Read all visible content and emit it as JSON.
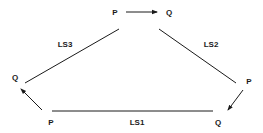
{
  "diagram": {
    "nodes": {
      "top_p": "P",
      "top_q": "Q",
      "left_q": "Q",
      "right_p": "P",
      "bottom_left_p": "P",
      "bottom_right_q": "Q"
    },
    "edges": {
      "ls1": "LS1",
      "ls2": "LS2",
      "ls3": "LS3"
    },
    "colors": {
      "stroke": "#1a1a1a",
      "background": "#ffffff"
    }
  }
}
